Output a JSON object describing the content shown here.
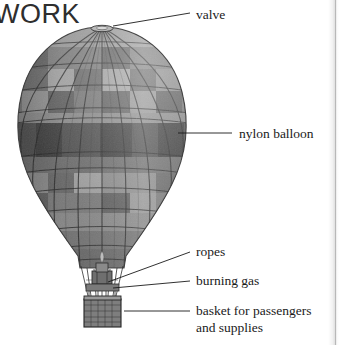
{
  "page": {
    "heading": "WORK",
    "background_color": "#ffffff",
    "text_color": "#1a1a1a",
    "width": 342,
    "height": 345
  },
  "illustration": {
    "name": "hot-air-balloon",
    "description": "Grayscale engraving-style hot air balloon with vertical gore panels, alternating light and dark horizontal bands, suspension ropes, burner and wicker basket",
    "colors": {
      "envelope_light": "#8f8f8f",
      "envelope_mid": "#7a7a7a",
      "envelope_dark": "#4e4e4e",
      "envelope_darkest": "#3b3b3b",
      "seam": "#2b2b2b",
      "basket": "#6b6b6b",
      "leader_line": "#1a1a1a"
    }
  },
  "labels": [
    {
      "id": "valve",
      "text": "valve",
      "line2": ""
    },
    {
      "id": "nylon",
      "text": "nylon balloon",
      "line2": ""
    },
    {
      "id": "ropes",
      "text": "ropes",
      "line2": ""
    },
    {
      "id": "gas",
      "text": "burning gas",
      "line2": ""
    },
    {
      "id": "basket",
      "text": "basket for passengers",
      "line2": "and supplies"
    }
  ]
}
